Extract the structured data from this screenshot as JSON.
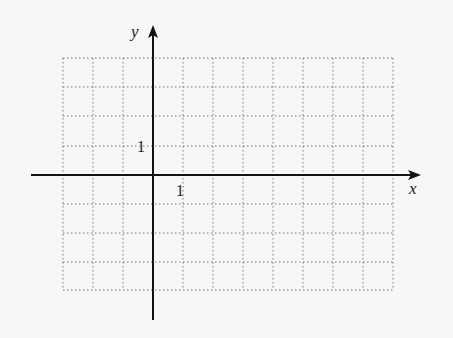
{
  "diagram": {
    "type": "coordinate-grid",
    "x_axis_label": "x",
    "y_axis_label": "y",
    "x_tick_label": "1",
    "y_tick_label": "1",
    "x_range": [
      -3,
      8
    ],
    "y_range": [
      -4,
      4
    ],
    "grid_style": "dotted",
    "colors": {
      "background": "#f7f7f6",
      "axis": "#111111",
      "grid": "#777777"
    }
  }
}
